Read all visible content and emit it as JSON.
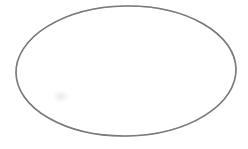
{
  "canvas": {
    "width": 248,
    "height": 149,
    "background_color": "#ffffff",
    "title": "Ellipse outline"
  },
  "figure": {
    "shape": "ellipse",
    "fill": "none",
    "fill_color": "#ffffff",
    "stroke_color": "#6e6e70",
    "stroke_width": 1.6,
    "center_x": 126,
    "center_y": 71,
    "radius_x": 110,
    "radius_y": 65,
    "rotation_degrees": -1,
    "bounds": {
      "left": 16,
      "top": 6,
      "right": 237,
      "bottom": 136
    }
  },
  "artifacts": {
    "scan_smudge": {
      "present": true,
      "x": 52,
      "y": 90,
      "width": 18,
      "height": 13,
      "color": "#bebebe"
    }
  }
}
